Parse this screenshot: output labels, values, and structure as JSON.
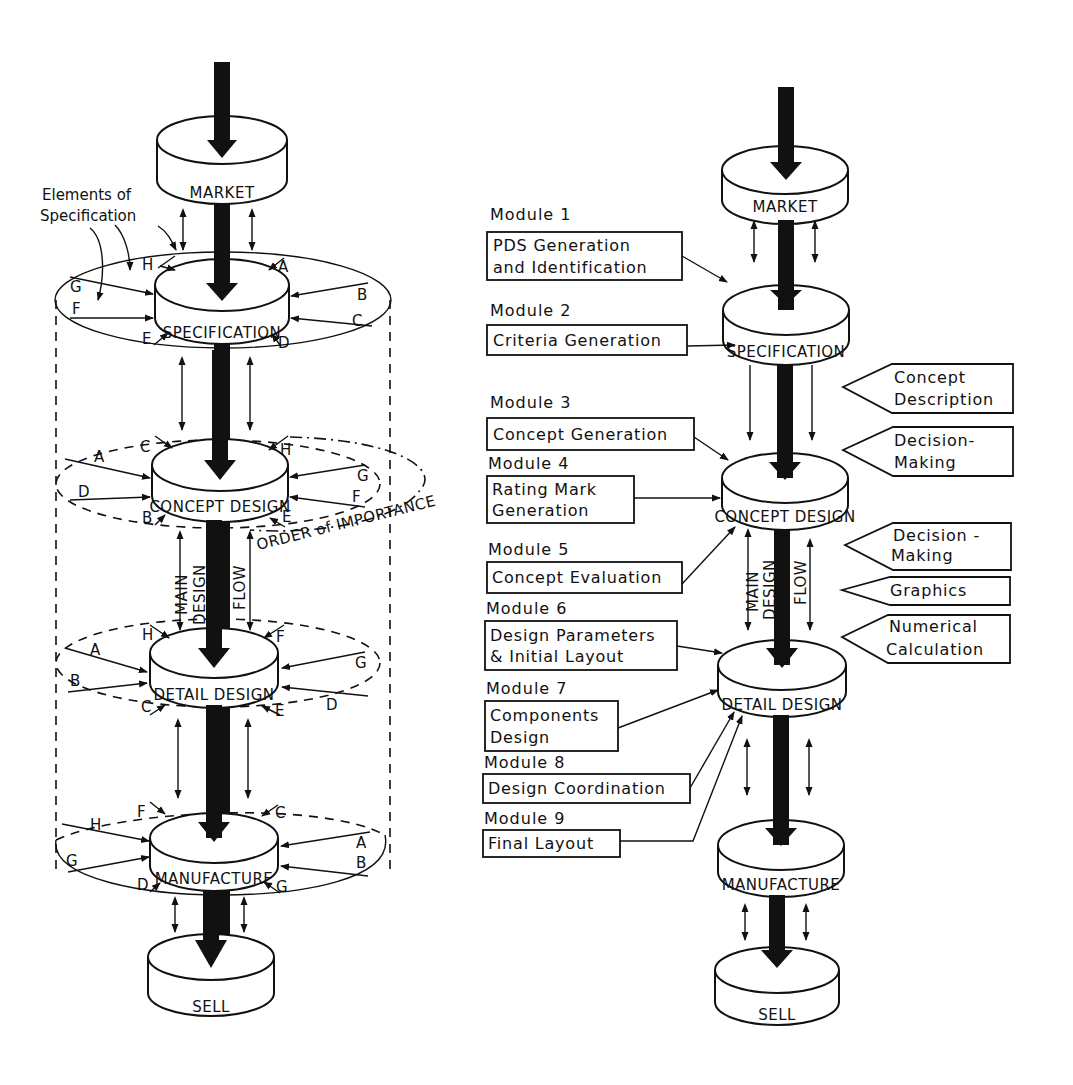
{
  "left_diagram": {
    "stages": [
      "MARKET",
      "SPECIFICATION",
      "CONCEPT DESIGN",
      "DETAIL DESIGN",
      "MANUFACTURE",
      "SELL"
    ],
    "annotation_elements": "Elements of",
    "annotation_elements_2": "Specification",
    "order_label": "ORDER of IMPORTANCE",
    "flow_label_1": "MAIN",
    "flow_label_2": "DESIGN",
    "flow_label_3": "FLOW",
    "specification_letters": [
      "H",
      "A",
      "G",
      "B",
      "F",
      "C",
      "E",
      "D"
    ],
    "concept_letters": [
      "C",
      "H",
      "A",
      "G",
      "D",
      "F",
      "B",
      "E"
    ],
    "detail_letters": [
      "H",
      "F",
      "A",
      "G",
      "B",
      "D",
      "C",
      "E"
    ],
    "manufacture_letters": [
      "F",
      "C",
      "H",
      "A",
      "G",
      "B",
      "D",
      "G"
    ]
  },
  "right_diagram": {
    "stages": [
      "MARKET",
      "SPECIFICATION",
      "CONCEPT DESIGN",
      "DETAIL DESIGN",
      "MANUFACTURE",
      "SELL"
    ],
    "flow_label_1": "MAIN",
    "flow_label_2": "DESIGN",
    "flow_label_3": "FLOW",
    "modules": [
      {
        "title": "Module 1",
        "line1": "PDS Generation",
        "line2": "and Identification"
      },
      {
        "title": "Module 2",
        "line1": "Criteria Generation",
        "line2": ""
      },
      {
        "title": "Module 3",
        "line1": "Concept Generation",
        "line2": ""
      },
      {
        "title": "Module 4",
        "line1": "Rating Mark",
        "line2": "Generation"
      },
      {
        "title": "Module 5",
        "line1": "Concept Evaluation",
        "line2": ""
      },
      {
        "title": "Module 6",
        "line1": "Design Parameters",
        "line2": "& Initial Layout"
      },
      {
        "title": "Module 7",
        "line1": "Components",
        "line2": "Design"
      },
      {
        "title": "Module 8",
        "line1": "Design Coordination",
        "line2": ""
      },
      {
        "title": "Module 9",
        "line1": "Final Layout",
        "line2": ""
      }
    ],
    "tools": [
      {
        "line1": "Concept",
        "line2": "Description"
      },
      {
        "line1": "Decision-",
        "line2": "Making"
      },
      {
        "line1": "Decision -",
        "line2": "Making"
      },
      {
        "line1": "Graphics",
        "line2": ""
      },
      {
        "line1": "Numerical",
        "line2": "Calculation"
      }
    ]
  }
}
